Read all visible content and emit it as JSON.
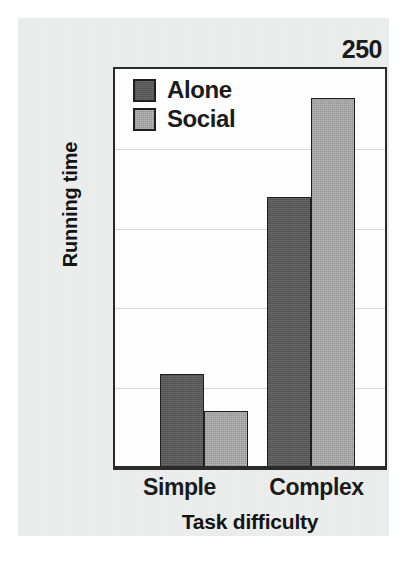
{
  "chart_data": {
    "type": "bar",
    "title": "",
    "xlabel": "Task difficulty",
    "ylabel": "Running time",
    "categories": [
      "Simple",
      "Complex"
    ],
    "series": [
      {
        "name": "Alone",
        "values": [
          59,
          170
        ],
        "color": "#595959"
      },
      {
        "name": "Social",
        "values": [
          36,
          232
        ],
        "color": "#a8a8a8"
      }
    ],
    "ylim": [
      0,
      250
    ],
    "yticks": [
      0,
      50,
      100,
      150,
      200,
      250
    ],
    "ytick_labels": [
      "0",
      "50",
      "100",
      "150",
      "200",
      "250"
    ],
    "grid": true,
    "legend_position": "top-left"
  },
  "axis": {
    "y": {
      "label": "Running time",
      "ticks": [
        {
          "value": 250,
          "label": "250"
        },
        {
          "value": 200,
          "label": "200"
        },
        {
          "value": 150,
          "label": "150"
        },
        {
          "value": 100,
          "label": "100"
        },
        {
          "value": 50,
          "label": "50"
        },
        {
          "value": 0,
          "label": "0"
        }
      ]
    },
    "x": {
      "label": "Task difficulty",
      "ticks": [
        {
          "label": "Simple"
        },
        {
          "label": "Complex"
        }
      ]
    }
  },
  "legend": {
    "items": [
      {
        "label": "Alone",
        "color": "#595959"
      },
      {
        "label": "Social",
        "color": "#a8a8a8"
      }
    ]
  },
  "colors": {
    "alone": "#595959",
    "social": "#a8a8a8",
    "axis": "#2b2b2b",
    "grid": "#d9d9d9",
    "panel_background": "#eceded",
    "plot_background": "#ffffff"
  }
}
